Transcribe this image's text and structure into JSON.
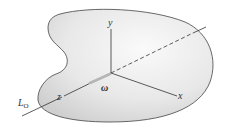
{
  "diagram": {
    "type": "rigid-body-rotation",
    "body_fill": "#e6e6e6",
    "body_stroke": "#444444",
    "axes": {
      "x_label": "x",
      "y_label": "y",
      "z_label": "z"
    },
    "angular_velocity_label": "ω",
    "line_label": "L",
    "line_label_subscript": "O"
  }
}
